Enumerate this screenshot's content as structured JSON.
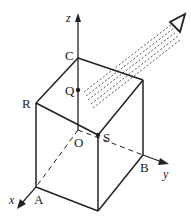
{
  "diagram": {
    "title": "",
    "type": "3D cube with coordinate axes and parallel light beam",
    "colors": {
      "stroke": "#222222",
      "background": "#ffffff"
    },
    "axes": {
      "x": "x",
      "y": "y",
      "z": "z"
    },
    "points": {
      "C": "C",
      "Q": "Q",
      "R": "R",
      "O": "O",
      "S": "S",
      "B": "B",
      "A": "A"
    },
    "beam": {
      "description": "parallel dashed rays from upper right toward point Q on z-axis",
      "direction_marker": "triangle-arrow"
    }
  }
}
